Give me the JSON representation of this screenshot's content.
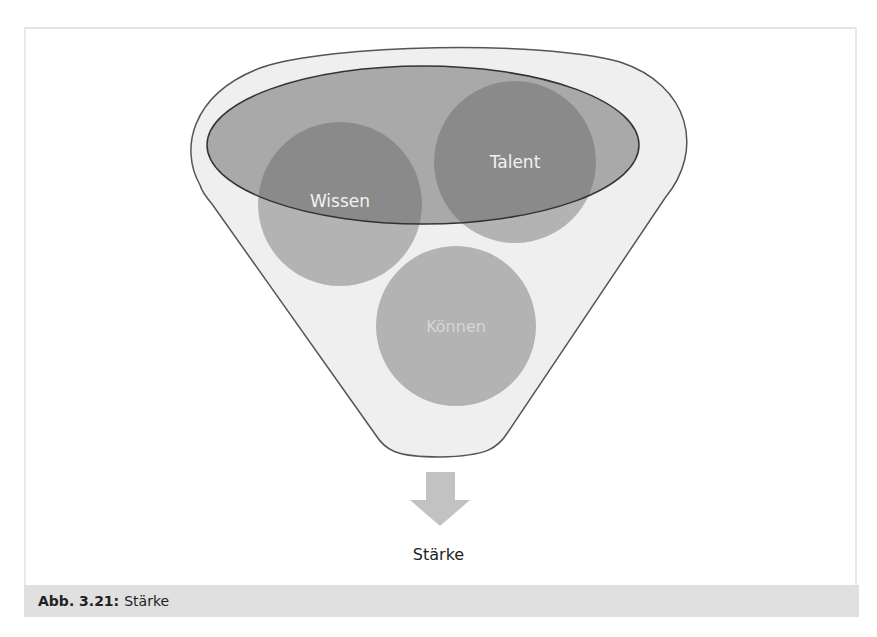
{
  "diagram": {
    "type": "funnel",
    "inputs": [
      {
        "label": "Wissen",
        "cx": 340,
        "cy": 204,
        "r": 82
      },
      {
        "label": "Talent",
        "cx": 515,
        "cy": 162,
        "r": 81
      },
      {
        "label": "Können",
        "cx": 456,
        "cy": 326,
        "r": 80
      }
    ],
    "output_label": "Stärke",
    "arrow_icon": "down-arrow-icon"
  },
  "caption": {
    "label": "Abb. 3.21:",
    "text": "Stärke"
  },
  "colors": {
    "funnel_fill": "#efefef",
    "funnel_stroke": "#555555",
    "ellipse_fill": "#a9a9a9",
    "circle_inside": "#8a8a8a",
    "circle_outside": "#b3b3b3",
    "text_on_dark": "#f2f2f2",
    "text_on_light": "#d6d6d6",
    "arrow_fill": "#c2c2c2",
    "caption_bg": "#e0e0e0"
  }
}
